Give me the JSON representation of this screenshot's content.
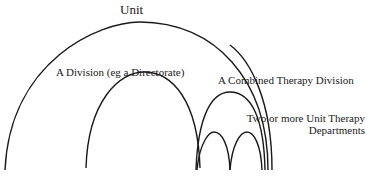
{
  "diagram": {
    "type": "nested-arches",
    "labels": {
      "unit": "Unit",
      "division": "A Division (eg a Directorate)",
      "combined": "A Combined Therapy Division",
      "departments_line1": "Two or more Unit Therapy",
      "departments_line2": "Departments"
    },
    "stroke_color": "#1a1a1a",
    "background": "#ffffff"
  }
}
